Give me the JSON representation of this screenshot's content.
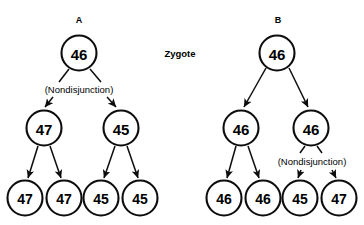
{
  "figure": {
    "background_color": "#ffffff",
    "stroke_color": "#0d0d0d",
    "center_annotation": "Zygote"
  },
  "panels": [
    {
      "id": "A",
      "label": "A",
      "nondisjunction_label": "(Nondisjunction)",
      "nondisjunction_stage": "first-division",
      "levels": [
        {
          "name": "zygote",
          "nodes": [
            {
              "value": "46"
            }
          ]
        },
        {
          "name": "two-cell",
          "nodes": [
            {
              "value": "47"
            },
            {
              "value": "45"
            }
          ]
        },
        {
          "name": "four-cell",
          "nodes": [
            {
              "value": "47"
            },
            {
              "value": "47"
            },
            {
              "value": "45"
            },
            {
              "value": "45"
            }
          ]
        }
      ]
    },
    {
      "id": "B",
      "label": "B",
      "nondisjunction_label": "(Nondisjunction)",
      "nondisjunction_stage": "second-division",
      "levels": [
        {
          "name": "zygote",
          "nodes": [
            {
              "value": "46"
            }
          ]
        },
        {
          "name": "two-cell",
          "nodes": [
            {
              "value": "46"
            },
            {
              "value": "46"
            }
          ]
        },
        {
          "name": "four-cell",
          "nodes": [
            {
              "value": "46"
            },
            {
              "value": "46"
            },
            {
              "value": "45"
            },
            {
              "value": "47"
            }
          ]
        }
      ]
    }
  ]
}
